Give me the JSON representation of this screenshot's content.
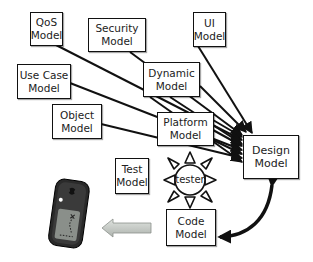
{
  "diagram": {
    "nodes": {
      "qos": {
        "line1": "QoS",
        "line2": "Model"
      },
      "security": {
        "line1": "Security",
        "line2": "Model"
      },
      "ui": {
        "line1": "UI",
        "line2": "Model"
      },
      "dynamic": {
        "line1": "Dynamic",
        "line2": "Model"
      },
      "use_case": {
        "line1": "Use Case",
        "line2": "Model"
      },
      "object": {
        "line1": "Object",
        "line2": "Model"
      },
      "platform": {
        "line1": "Platform",
        "line2": "Model"
      },
      "design": {
        "line1": "Design",
        "line2": "Model"
      },
      "test": {
        "line1": "Test",
        "line2": "Model"
      },
      "code": {
        "line1": "Code",
        "line2": "Model"
      }
    },
    "tester": {
      "label": "tester"
    },
    "edges": [
      {
        "from": "QoS Model",
        "to": "Design Model",
        "type": "arrow"
      },
      {
        "from": "Security Model",
        "to": "Design Model",
        "type": "arrow"
      },
      {
        "from": "UI Model",
        "to": "Design Model",
        "type": "arrow"
      },
      {
        "from": "Dynamic Model",
        "to": "Design Model",
        "type": "arrow"
      },
      {
        "from": "Use Case Model",
        "to": "Design Model",
        "type": "arrow"
      },
      {
        "from": "Object Model",
        "to": "Design Model",
        "type": "arrow"
      },
      {
        "from": "Platform Model",
        "to": "Design Model",
        "type": "arrow"
      },
      {
        "from": "Design Model",
        "to": "Code Model",
        "type": "bidirectional-curved"
      },
      {
        "from": "Code Model",
        "to": "device",
        "type": "block-arrow"
      }
    ],
    "colors": {
      "stroke": "#111111",
      "box_fill": "#ffffff",
      "block_arrow": "#c4c9c4",
      "device_body": "#2a2a2a",
      "device_screen": "#8a8f8a"
    }
  }
}
